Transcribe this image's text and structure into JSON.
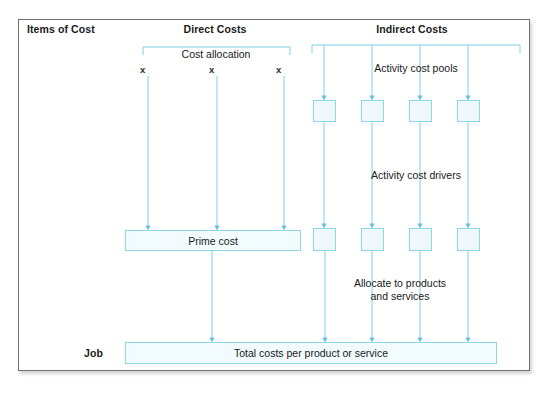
{
  "figure": {
    "caption_fragment": "",
    "frame": {
      "x": 18,
      "y": 19,
      "w": 512,
      "h": 352
    }
  },
  "colors": {
    "line": "#7fd0e6",
    "box_border": "#8ed6e8",
    "box_fill": "#f2fbfd",
    "small_box_fill": "#eff9fc",
    "frame_border": "#6f6f6f",
    "text": "#1a1a1a"
  },
  "headers": {
    "items_of_cost": "Items of Cost",
    "direct_costs": "Direct Costs",
    "indirect_costs": "Indirect Costs"
  },
  "row_labels": {
    "job": "Job"
  },
  "annotations": {
    "cost_allocation": "Cost allocation",
    "activity_cost_pools": "Activity cost pools",
    "activity_cost_drivers": "Activity cost drivers",
    "allocate_line_1": "Allocate to products",
    "allocate_line_2": "and services"
  },
  "direct": {
    "x_markers": [
      "x",
      "x",
      "x"
    ],
    "marker_positions": [
      143,
      212,
      279
    ],
    "line_positions": [
      148,
      217,
      284
    ],
    "bracket": {
      "left": 143,
      "right": 290,
      "top": 47,
      "drop": 8
    },
    "prime_cost": {
      "label": "Prime cost",
      "x": 125,
      "y": 230,
      "w": 176,
      "h": 21
    }
  },
  "indirect": {
    "bracket": {
      "left": 312,
      "right": 520,
      "top": 45,
      "drop": 8
    },
    "column_positions": [
      324,
      372,
      420,
      468
    ],
    "pool_boxes": [
      {
        "x": 313,
        "y": 100,
        "w": 23,
        "h": 22
      },
      {
        "x": 361,
        "y": 100,
        "w": 23,
        "h": 22
      },
      {
        "x": 409,
        "y": 100,
        "w": 23,
        "h": 22
      },
      {
        "x": 457,
        "y": 100,
        "w": 23,
        "h": 22
      }
    ],
    "driver_boxes": [
      {
        "x": 313,
        "y": 228,
        "w": 23,
        "h": 23
      },
      {
        "x": 361,
        "y": 228,
        "w": 23,
        "h": 23
      },
      {
        "x": 409,
        "y": 228,
        "w": 23,
        "h": 23
      },
      {
        "x": 457,
        "y": 228,
        "w": 23,
        "h": 23
      }
    ]
  },
  "total": {
    "label": "Total costs per product or service",
    "x": 125,
    "y": 342,
    "w": 372,
    "h": 22,
    "incoming_arrows": [
      212,
      325,
      372,
      420,
      468
    ]
  }
}
